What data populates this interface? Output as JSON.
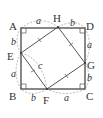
{
  "diagram": {
    "type": "geometry",
    "colors": {
      "line": "#555555",
      "dashed": "#999999",
      "text": "#333333",
      "background": "#ffffff"
    },
    "points": {
      "A": "A",
      "B": "B",
      "C": "C",
      "D": "D",
      "E": "E",
      "F": "F",
      "G": "G",
      "H": "H"
    },
    "segment_labels": {
      "AH": "a",
      "HD": "b",
      "DG": "a",
      "GC": "b",
      "CF": "a",
      "FB": "b",
      "BE": "a",
      "EA": "b",
      "EF": "c"
    },
    "markers": {
      "right_angles": [
        "A",
        "B",
        "C",
        "D"
      ],
      "equal_ticks": [
        "EH",
        "HG",
        "GF",
        "FE"
      ]
    }
  }
}
